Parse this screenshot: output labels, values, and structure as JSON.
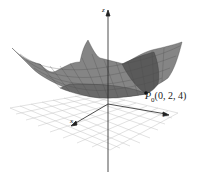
{
  "figure": {
    "type": "3d-surface-plot",
    "axes": {
      "z_label": "z",
      "x_label": "x",
      "y_label": "y"
    },
    "point": {
      "name": "P",
      "subscript": "0",
      "coords": "(0, 2, 4)"
    },
    "colors": {
      "surface": "#7a7a7a",
      "surface_dark": "#4a4a4a",
      "mesh": "#3a3a3a",
      "grid_plane": "#bdbdbd",
      "axis": "#222222"
    }
  }
}
